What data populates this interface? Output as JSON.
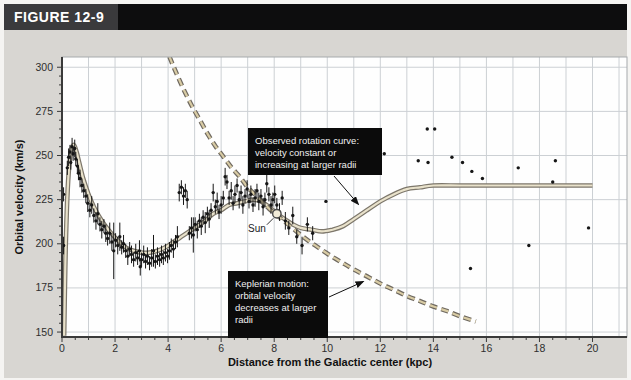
{
  "figure": {
    "label": "FIGURE 12-9"
  },
  "colors": {
    "page_bg": "#f5f4f2",
    "panel_bg": "#d8d6d2",
    "header_label_bg": "#3a3a3c",
    "header_strip_bg": "#0d0d0e",
    "header_text": "#ffffff",
    "plot_bg": "#fefefe",
    "gridline": "#ccd0d4",
    "frame": "#a6a9ac",
    "axis": "#3a3a3a",
    "tick_text": "#2e2e2e",
    "scatter": "#161616",
    "observed_outer": "#7d776b",
    "observed_inner": "#e9e2cb",
    "keplerian_outer": "#6f6960",
    "keplerian_inner": "#d8cba4",
    "annotation_bg": "#0b0b0b",
    "annotation_text": "#f0f0f0",
    "sun_fill": "#f2ecd9",
    "sun_stroke": "#4a4a4a",
    "arrow": "#111111"
  },
  "chart_data": {
    "type": "scatter",
    "title": "",
    "xlabel": "Distance from the Galactic center (kpc)",
    "ylabel": "Orbital velocity (km/s)",
    "xlim": [
      0,
      21.3
    ],
    "ylim": [
      147.2,
      305.8
    ],
    "x_major_ticks": [
      0,
      2,
      4,
      6,
      8,
      10,
      12,
      14,
      16,
      18,
      20
    ],
    "x_minor_step": 0.5,
    "x_grid_step": 1,
    "y_major_ticks": [
      150,
      175,
      200,
      225,
      250,
      275,
      300
    ],
    "y_minor_step": 5,
    "grid": true,
    "legend": "none",
    "series": [
      {
        "name": "Observed rotation curve",
        "style": "solid-road",
        "points": [
          [
            0.08,
            148
          ],
          [
            0.1,
            168
          ],
          [
            0.14,
            198
          ],
          [
            0.2,
            226
          ],
          [
            0.27,
            244
          ],
          [
            0.35,
            253
          ],
          [
            0.45,
            256
          ],
          [
            0.55,
            252
          ],
          [
            0.65,
            246
          ],
          [
            0.8,
            237
          ],
          [
            1.0,
            228
          ],
          [
            1.2,
            221
          ],
          [
            1.5,
            213
          ],
          [
            1.8,
            207
          ],
          [
            2.1,
            202
          ],
          [
            2.4,
            198
          ],
          [
            2.7,
            196
          ],
          [
            3.0,
            195
          ],
          [
            3.3,
            195
          ],
          [
            3.6,
            196
          ],
          [
            3.9,
            198
          ],
          [
            4.2,
            201
          ],
          [
            4.5,
            204
          ],
          [
            4.8,
            207
          ],
          [
            5.1,
            210
          ],
          [
            5.4,
            213
          ],
          [
            5.7,
            217
          ],
          [
            6.0,
            219
          ],
          [
            6.3,
            222
          ],
          [
            6.6,
            223
          ],
          [
            6.9,
            224
          ],
          [
            7.2,
            225
          ],
          [
            7.5,
            224
          ],
          [
            7.8,
            221
          ],
          [
            8.1,
            217
          ],
          [
            8.4,
            214
          ],
          [
            8.7,
            211
          ],
          [
            9.0,
            209
          ],
          [
            9.4,
            208
          ],
          [
            9.8,
            207
          ],
          [
            10.2,
            208
          ],
          [
            10.6,
            210
          ],
          [
            11.0,
            214
          ],
          [
            11.5,
            219
          ],
          [
            12.0,
            224
          ],
          [
            12.5,
            228
          ],
          [
            13.0,
            231
          ],
          [
            13.5,
            232
          ],
          [
            14.0,
            233
          ],
          [
            15.0,
            233
          ],
          [
            16.0,
            233
          ],
          [
            17.0,
            233
          ],
          [
            18.0,
            233
          ],
          [
            19.0,
            233
          ],
          [
            20.0,
            233
          ]
        ]
      },
      {
        "name": "Keplerian motion",
        "style": "dashed-road",
        "points": [
          [
            4.05,
            306
          ],
          [
            4.3,
            297
          ],
          [
            4.6,
            287
          ],
          [
            4.9,
            278
          ],
          [
            5.2,
            270
          ],
          [
            5.5,
            262
          ],
          [
            5.8,
            255
          ],
          [
            6.1,
            249
          ],
          [
            6.4,
            243
          ],
          [
            6.7,
            238
          ],
          [
            7.0,
            232
          ],
          [
            7.4,
            226
          ],
          [
            7.8,
            220
          ],
          [
            8.2,
            215
          ],
          [
            8.6,
            210
          ],
          [
            9.0,
            205
          ],
          [
            9.4,
            200.5
          ],
          [
            9.8,
            196.5
          ],
          [
            10.2,
            192.5
          ],
          [
            10.6,
            189
          ],
          [
            11.0,
            185.5
          ],
          [
            11.5,
            181.5
          ],
          [
            12.0,
            177.5
          ],
          [
            12.5,
            174
          ],
          [
            13.0,
            170.5
          ],
          [
            13.5,
            167.5
          ],
          [
            14.0,
            164.5
          ],
          [
            14.5,
            162
          ],
          [
            15.0,
            159
          ],
          [
            15.6,
            156
          ]
        ]
      }
    ],
    "scatter": {
      "name": "measured orbital velocities (dots with error bars)",
      "points": [
        [
          0.06,
          199,
          5
        ],
        [
          0.06,
          228,
          4
        ],
        [
          0.2,
          243,
          4
        ],
        [
          0.25,
          249,
          5
        ],
        [
          0.3,
          252,
          4
        ],
        [
          0.33,
          246,
          4
        ],
        [
          0.38,
          255,
          5
        ],
        [
          0.42,
          251,
          4
        ],
        [
          0.48,
          254,
          5
        ],
        [
          0.52,
          248,
          4
        ],
        [
          0.58,
          244,
          4
        ],
        [
          0.62,
          240,
          4
        ],
        [
          0.68,
          237,
          5
        ],
        [
          0.75,
          233,
          4
        ],
        [
          0.82,
          230,
          4
        ],
        [
          0.9,
          227,
          4
        ],
        [
          0.97,
          223,
          5
        ],
        [
          1.05,
          219,
          4
        ],
        [
          1.12,
          222,
          5
        ],
        [
          1.2,
          216,
          4
        ],
        [
          1.28,
          213,
          5
        ],
        [
          1.35,
          217,
          6
        ],
        [
          1.43,
          211,
          4
        ],
        [
          1.5,
          208,
          5
        ],
        [
          1.58,
          210,
          4
        ],
        [
          1.65,
          206,
          5
        ],
        [
          1.72,
          203,
          4
        ],
        [
          1.8,
          206,
          6
        ],
        [
          1.88,
          201,
          5
        ],
        [
          1.95,
          196,
          16
        ],
        [
          2.02,
          202,
          4
        ],
        [
          2.1,
          199,
          5
        ],
        [
          2.18,
          204,
          8
        ],
        [
          2.25,
          198,
          4
        ],
        [
          2.32,
          200,
          5
        ],
        [
          2.4,
          196,
          4
        ],
        [
          2.48,
          193,
          5
        ],
        [
          2.55,
          197,
          4
        ],
        [
          2.62,
          194,
          5
        ],
        [
          2.7,
          191,
          4
        ],
        [
          2.78,
          195,
          5
        ],
        [
          2.85,
          192,
          4
        ],
        [
          2.92,
          196,
          6
        ],
        [
          2.95,
          187,
          5
        ],
        [
          3.0,
          191,
          4
        ],
        [
          3.08,
          194,
          5
        ],
        [
          3.15,
          190,
          4
        ],
        [
          3.22,
          193,
          5
        ],
        [
          3.3,
          189,
          4
        ],
        [
          3.38,
          192,
          5
        ],
        [
          3.45,
          196,
          9
        ],
        [
          3.52,
          190,
          4
        ],
        [
          3.6,
          193,
          5
        ],
        [
          3.68,
          191,
          4
        ],
        [
          3.75,
          194,
          5
        ],
        [
          3.82,
          192,
          4
        ],
        [
          3.9,
          195,
          5
        ],
        [
          3.98,
          193,
          4
        ],
        [
          4.05,
          196,
          5
        ],
        [
          4.12,
          199,
          4
        ],
        [
          4.2,
          197,
          5
        ],
        [
          4.28,
          201,
          4
        ],
        [
          4.35,
          204,
          6
        ],
        [
          4.42,
          229,
          5
        ],
        [
          4.5,
          232,
          4
        ],
        [
          4.58,
          227,
          5
        ],
        [
          4.65,
          230,
          4
        ],
        [
          4.72,
          225,
          5
        ],
        [
          4.8,
          206,
          4
        ],
        [
          4.88,
          209,
          6
        ],
        [
          4.95,
          205,
          10
        ],
        [
          5.02,
          211,
          4
        ],
        [
          5.1,
          208,
          5
        ],
        [
          5.18,
          213,
          4
        ],
        [
          5.25,
          210,
          5
        ],
        [
          5.32,
          215,
          4
        ],
        [
          5.4,
          212,
          6
        ],
        [
          5.48,
          217,
          4
        ],
        [
          5.55,
          214,
          5
        ],
        [
          5.62,
          219,
          4
        ],
        [
          5.7,
          229,
          5
        ],
        [
          5.78,
          221,
          4
        ],
        [
          5.85,
          224,
          5
        ],
        [
          5.92,
          218,
          4
        ],
        [
          6.0,
          222,
          5
        ],
        [
          6.08,
          226,
          4
        ],
        [
          6.15,
          238,
          5
        ],
        [
          6.22,
          235,
          4
        ],
        [
          6.3,
          226,
          4
        ],
        [
          6.38,
          230,
          5
        ],
        [
          6.45,
          223,
          4
        ],
        [
          6.52,
          228,
          5
        ],
        [
          6.6,
          233,
          4
        ],
        [
          6.68,
          225,
          5
        ],
        [
          6.75,
          229,
          4
        ],
        [
          6.82,
          222,
          5
        ],
        [
          6.9,
          227,
          4
        ],
        [
          6.98,
          231,
          5
        ],
        [
          7.05,
          224,
          4
        ],
        [
          7.12,
          228,
          5
        ],
        [
          7.2,
          222,
          4
        ],
        [
          7.28,
          226,
          5
        ],
        [
          7.35,
          230,
          4
        ],
        [
          7.42,
          224,
          5
        ],
        [
          7.5,
          227,
          4
        ],
        [
          7.58,
          221,
          5
        ],
        [
          7.65,
          225,
          4
        ],
        [
          7.72,
          234,
          5
        ],
        [
          7.8,
          228,
          4
        ],
        [
          7.88,
          222,
          5
        ],
        [
          7.95,
          225,
          4
        ],
        [
          8.02,
          228,
          5
        ],
        [
          8.1,
          222,
          4
        ],
        [
          8.2,
          218,
          5
        ],
        [
          8.3,
          226,
          4
        ],
        [
          8.42,
          213,
          5
        ],
        [
          8.55,
          209,
          4
        ],
        [
          8.7,
          216,
          5
        ],
        [
          8.85,
          204,
          4
        ],
        [
          9.05,
          199,
          5
        ],
        [
          9.25,
          211,
          4
        ],
        [
          9.45,
          206,
          4
        ],
        [
          9.95,
          224,
          0
        ],
        [
          12.15,
          251,
          0
        ],
        [
          13.43,
          247,
          0
        ],
        [
          13.77,
          265,
          0
        ],
        [
          14.05,
          265,
          0
        ],
        [
          13.8,
          246,
          0
        ],
        [
          14.7,
          249,
          0
        ],
        [
          15.1,
          246,
          0
        ],
        [
          15.45,
          241,
          0
        ],
        [
          15.85,
          237,
          0
        ],
        [
          15.4,
          186,
          0
        ],
        [
          17.2,
          243,
          0
        ],
        [
          17.6,
          199,
          0
        ],
        [
          18.5,
          235,
          0
        ],
        [
          18.6,
          247,
          0
        ],
        [
          19.85,
          209,
          0
        ]
      ]
    },
    "sun": {
      "label": "Sun",
      "r_kpc": 8.1,
      "v_kms": 217
    },
    "annotations": [
      {
        "id": "observed-note",
        "lines": [
          "Observed rotation curve:",
          "velocity constant or",
          "increasing at larger radii"
        ],
        "box_px": {
          "x": 248,
          "y": 128,
          "w": 134,
          "h": 47
        },
        "arrow_px": {
          "from": [
            334,
            176
          ],
          "to": [
            358.5,
            204.5
          ]
        }
      },
      {
        "id": "keplerian-note",
        "lines": [
          "Keplerian motion:",
          "orbital velocity",
          "decreases at larger",
          "radii"
        ],
        "box_px": {
          "x": 228,
          "y": 271,
          "w": 100,
          "h": 67
        },
        "arrow_px": {
          "from": [
            329,
            297
          ],
          "to": [
            363.5,
            281.5
          ]
        }
      }
    ]
  }
}
